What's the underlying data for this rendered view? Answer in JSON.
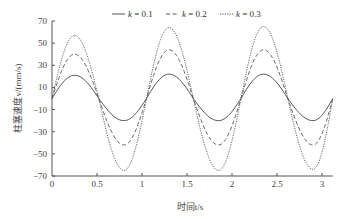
{
  "chart_data": {
    "type": "line",
    "title": "",
    "xlabel": "时间t/s",
    "ylabel": "柱塞速度v/(mm/s)",
    "xlim": [
      0,
      3.12
    ],
    "ylim": [
      -70,
      70
    ],
    "xticks": [
      0,
      0.5,
      1,
      1.5,
      2,
      2.5,
      3
    ],
    "xtick_labels": [
      "0",
      "0.5",
      "1",
      "1.5",
      "2",
      "2.5",
      "3"
    ],
    "yticks": [
      -70,
      -50,
      -30,
      -10,
      10,
      30,
      50,
      70
    ],
    "ytick_labels": [
      "−70",
      "−50",
      "−30",
      "−10",
      "10",
      "30",
      "50",
      "70"
    ],
    "grid": false,
    "legend_position": "top",
    "period_s": 1.05,
    "series": [
      {
        "name": "k = 0.1",
        "style": "solid",
        "x": [
          0,
          0.25,
          0.52,
          0.8,
          1.05,
          1.3,
          1.57,
          1.85,
          2.1,
          2.35,
          2.62,
          2.9,
          3.12
        ],
        "values": [
          0,
          21,
          0,
          -20,
          0,
          22,
          0,
          -20,
          0,
          22,
          0,
          -20,
          0
        ]
      },
      {
        "name": "k = 0.2",
        "style": "dashed",
        "x": [
          0,
          0.25,
          0.52,
          0.8,
          1.05,
          1.3,
          1.57,
          1.85,
          2.1,
          2.35,
          2.62,
          2.9,
          3.12
        ],
        "values": [
          0,
          40,
          0,
          -42,
          0,
          44,
          0,
          -42,
          0,
          44,
          0,
          -42,
          0
        ]
      },
      {
        "name": "k = 0.3",
        "style": "dotted",
        "x": [
          0,
          0.25,
          0.52,
          0.8,
          1.05,
          1.3,
          1.57,
          1.85,
          2.1,
          2.35,
          2.62,
          2.9,
          3.12
        ],
        "values": [
          0,
          57,
          0,
          -65,
          0,
          64,
          0,
          -65,
          0,
          65,
          0,
          -64,
          0
        ]
      }
    ]
  },
  "legend": {
    "items": [
      {
        "label": "k = 0.1",
        "style": "solid"
      },
      {
        "label": "k = 0.2",
        "style": "dashed"
      },
      {
        "label": "k = 0.3",
        "style": "dotted"
      }
    ]
  },
  "colors": {
    "line": "#555555",
    "axis": "#555555",
    "text": "#444444"
  }
}
